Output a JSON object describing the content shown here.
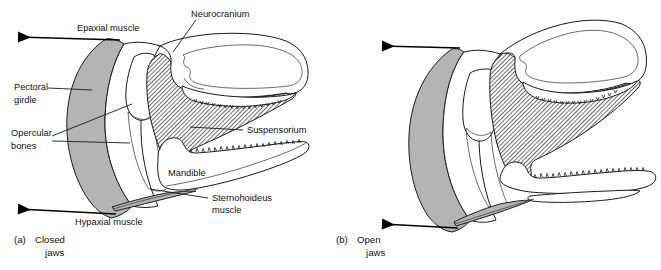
{
  "figure": {
    "background_color": "#ffffff",
    "line_color": "#1a1a1a",
    "girdle_color": "#b4b4b4",
    "hatch_color": "#555555"
  },
  "panels": [
    {
      "id": "a",
      "caption_prefix": "(a)",
      "caption_line1": "Closed",
      "caption_line2": "jaws",
      "labels": [
        {
          "key": "epaxial",
          "text": "Epaxial muscle"
        },
        {
          "key": "neurocranium",
          "text": "Neurocranium"
        },
        {
          "key": "pectoral1",
          "text": "Pectoral"
        },
        {
          "key": "pectoral2",
          "text": "girdle"
        },
        {
          "key": "opercular1",
          "text": "Opercular"
        },
        {
          "key": "opercular2",
          "text": "bones"
        },
        {
          "key": "suspensorium",
          "text": "Suspensorium"
        },
        {
          "key": "mandible",
          "text": "Mandible"
        },
        {
          "key": "sterno1",
          "text": "Sternohoideus"
        },
        {
          "key": "sterno2",
          "text": "muscle"
        },
        {
          "key": "hypaxial",
          "text": "Hypaxial muscle"
        }
      ]
    },
    {
      "id": "b",
      "caption_prefix": "(b)",
      "caption_line1": "Open",
      "caption_line2": "jaws",
      "labels": []
    }
  ],
  "structures": [
    {
      "name": "neurocranium",
      "style": "white-outline"
    },
    {
      "name": "pectoral-girdle",
      "style": "gray-fill"
    },
    {
      "name": "opercular-bones",
      "style": "white-outline"
    },
    {
      "name": "suspensorium",
      "style": "hatched"
    },
    {
      "name": "mandible",
      "style": "white-outline"
    },
    {
      "name": "sternohoideus-muscle",
      "style": "gray-fill"
    }
  ],
  "arrows": [
    {
      "name": "epaxial-arrow",
      "panel": "a",
      "direction": "left"
    },
    {
      "name": "hypaxial-arrow",
      "panel": "a",
      "direction": "left"
    },
    {
      "name": "epaxial-arrow",
      "panel": "b",
      "direction": "left"
    },
    {
      "name": "hypaxial-arrow",
      "panel": "b",
      "direction": "left"
    }
  ]
}
